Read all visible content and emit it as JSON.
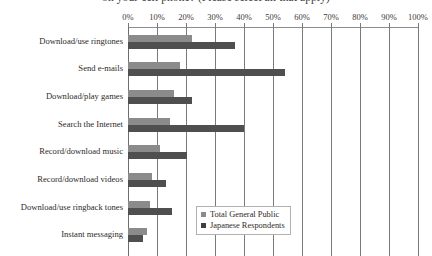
{
  "chart_data": {
    "type": "bar",
    "orientation": "horizontal",
    "title": "on your cell phone? (Please select all that apply)",
    "xlabel": "",
    "ylabel": "",
    "xlim": [
      0,
      100
    ],
    "xtick_labels": [
      "0%",
      "10%",
      "20%",
      "30%",
      "40%",
      "50%",
      "60%",
      "70%",
      "80%",
      "90%",
      "100%"
    ],
    "xtick_values": [
      0,
      10,
      20,
      30,
      40,
      50,
      60,
      70,
      80,
      90,
      100
    ],
    "grid": true,
    "legend_position": "inside-lower-center",
    "categories": [
      "Download/use ringtones",
      "Send e-mails",
      "Download/play games",
      "Search the Internet",
      "Record/download music",
      "Record/download videos",
      "Download/use ringback tones",
      "Instant messaging"
    ],
    "series": [
      {
        "name": "Total General Public",
        "color": "#8b8b8b",
        "values": [
          22,
          18,
          16,
          14.5,
          11,
          8.3,
          7.5,
          6.5
        ]
      },
      {
        "name": "Japanese Respondents",
        "color": "#4f4f4f",
        "values": [
          37,
          54,
          22,
          40,
          20.5,
          13,
          15,
          5
        ]
      }
    ]
  },
  "legend": {
    "items": [
      {
        "label": "Total General Public"
      },
      {
        "label": "Japanese Respondents"
      }
    ]
  },
  "colors": {
    "series_total_general_public": "#8b8b8b",
    "series_japanese_respondents": "#4f4f4f",
    "gridline": "#7a7a7a",
    "axis": "#8c8c8c",
    "text": "#2e2a28",
    "background": "#ffffff"
  }
}
